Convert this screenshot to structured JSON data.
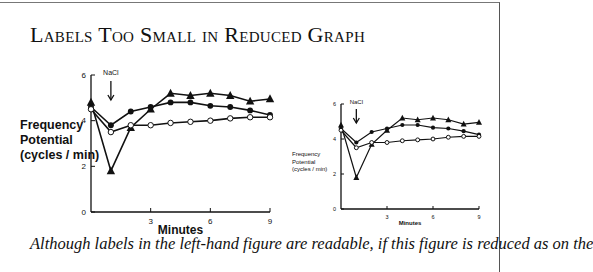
{
  "title": "Labels Too Small in Reduced Graph",
  "caption": "Although labels in the left-hand figure are readable, if this figure is reduced as on the",
  "chart_data": [
    {
      "type": "line",
      "panel": "left",
      "title": "",
      "xlabel": "Minutes",
      "ylabel": "Frequency Potential (cycles / min)",
      "ylabel_lines": [
        "Frequency",
        "Potential",
        "(cycles / min)"
      ],
      "xlim": [
        0,
        9
      ],
      "ylim": [
        0,
        6
      ],
      "xticks": [
        3,
        6,
        9
      ],
      "yticks": [
        0,
        2,
        4,
        6
      ],
      "annotation": {
        "text": "NaCl",
        "x": 1,
        "arrow": "down"
      },
      "grid": false,
      "x": [
        0,
        1,
        2,
        3,
        4,
        5,
        6,
        7,
        8,
        9
      ],
      "series": [
        {
          "name": "filled-triangle",
          "marker": "triangle-filled",
          "values": [
            4.8,
            1.8,
            3.7,
            4.5,
            5.2,
            5.1,
            5.2,
            5.1,
            4.85,
            4.95
          ]
        },
        {
          "name": "filled-circle",
          "marker": "circle-filled",
          "values": [
            4.6,
            3.8,
            4.4,
            4.6,
            4.8,
            4.8,
            4.65,
            4.6,
            4.45,
            4.25
          ]
        },
        {
          "name": "open-circle",
          "marker": "circle-open",
          "values": [
            4.5,
            3.5,
            3.8,
            3.8,
            3.9,
            3.95,
            4.0,
            4.1,
            4.15,
            4.15
          ]
        }
      ]
    },
    {
      "type": "line",
      "panel": "right (reduced)",
      "title": "",
      "xlabel": "Minutes",
      "ylabel": "Frequency Potential (cycles / min)",
      "ylabel_lines": [
        "Frequency",
        "Potential",
        "(cycles / min)"
      ],
      "xlim": [
        0,
        9
      ],
      "ylim": [
        0,
        6
      ],
      "xticks": [
        3,
        6,
        9
      ],
      "yticks": [
        0,
        2,
        4,
        6
      ],
      "annotation": {
        "text": "NaCl",
        "x": 1,
        "arrow": "down"
      },
      "grid": false,
      "x": [
        0,
        1,
        2,
        3,
        4,
        5,
        6,
        7,
        8,
        9
      ],
      "series": [
        {
          "name": "filled-triangle",
          "marker": "triangle-filled",
          "values": [
            4.8,
            1.8,
            3.7,
            4.5,
            5.2,
            5.1,
            5.2,
            5.1,
            4.85,
            4.95
          ]
        },
        {
          "name": "filled-circle",
          "marker": "circle-filled",
          "values": [
            4.6,
            3.8,
            4.4,
            4.6,
            4.8,
            4.8,
            4.65,
            4.6,
            4.45,
            4.25
          ]
        },
        {
          "name": "open-circle",
          "marker": "circle-open",
          "values": [
            4.5,
            3.5,
            3.8,
            3.8,
            3.9,
            3.95,
            4.0,
            4.1,
            4.15,
            4.15
          ]
        }
      ]
    }
  ]
}
